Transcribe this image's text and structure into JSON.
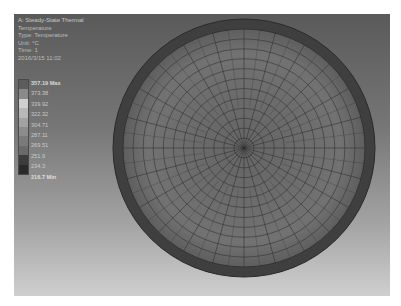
{
  "header": {
    "lines": [
      "A: Steady-State Thermal",
      "Temperature",
      "Type: Temperature",
      "Unit: °C",
      "Time: 1",
      "2016/3/15 11:02"
    ]
  },
  "legend": {
    "max_label": "357.19 Max",
    "values": [
      "373.38",
      "339.92",
      "322.32",
      "304.71",
      "287.11",
      "269.51",
      "251.9",
      "234.3"
    ],
    "min_label": "216.7 Min",
    "colors": [
      "#5c5c5c",
      "#8a8a8a",
      "#cfcfcf",
      "#b8b8b8",
      "#a2a2a2",
      "#8c8c8c",
      "#7a7a7a",
      "#6a6a6a",
      "#3c3c3c",
      "#2a2a2a"
    ]
  },
  "model": {
    "shape": "disc",
    "center_x": 230,
    "center_y": 134,
    "radius_x": 131,
    "radius_y": 129,
    "rim_width": 10,
    "mesh_rings": 12,
    "mesh_spokes": 24,
    "rim_color": "#3f3f3f",
    "face_color": "#6c6c6c",
    "mesh_line_color": "#2e2e2e"
  }
}
